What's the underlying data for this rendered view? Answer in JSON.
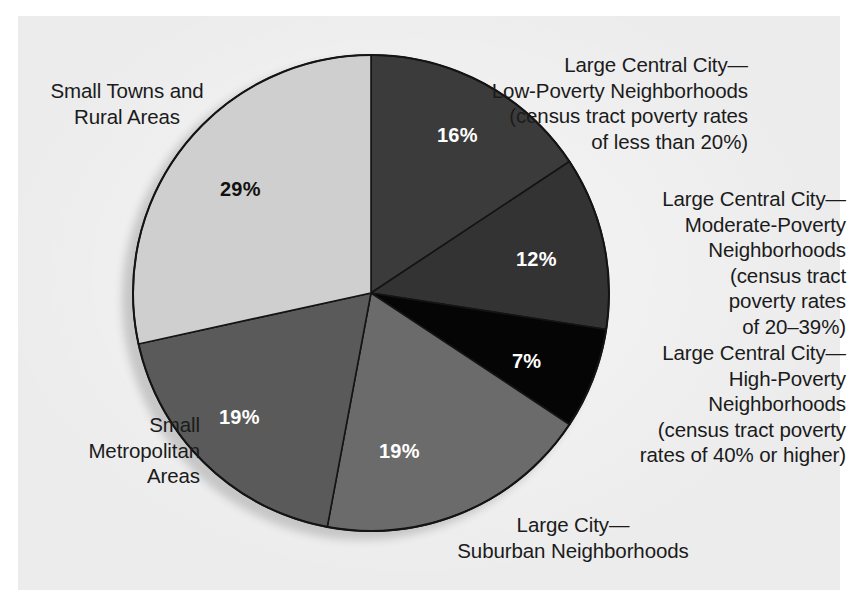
{
  "chart_data": {
    "type": "pie",
    "title": "",
    "subtitle": "",
    "xlabel": "",
    "ylabel": "",
    "legend_position": "callout-labels-around-pie",
    "grid": false,
    "start_angle_deg": 0,
    "direction": "clockwise",
    "total_percent": 102,
    "categories": [
      "Large Central City—Low-Poverty Neighborhoods (census tract poverty rates of less than 20%)",
      "Large Central City—Moderate-Poverty Neighborhoods (census tract poverty rates of 20–39%)",
      "Large Central City—High-Poverty Neighborhoods (census tract poverty rates of 40% or higher)",
      "Large City—Suburban Neighborhoods",
      "Small Metropolitan Areas",
      "Small Towns and Rural Areas"
    ],
    "values": [
      16,
      12,
      7,
      19,
      19,
      29
    ],
    "value_labels": [
      "16%",
      "12%",
      "7%",
      "19%",
      "19%",
      "29%"
    ],
    "slice_colors": [
      "#3b3b3b",
      "#333333",
      "#050505",
      "#6b6b6b",
      "#5a5a5a",
      "#cfcfcf"
    ],
    "slice_label_colors": [
      "#ffffff",
      "#ffffff",
      "#ffffff",
      "#ffffff",
      "#ffffff",
      "#111111"
    ],
    "slices": [
      {
        "name": "large-central-city-low-poverty",
        "value": 16,
        "label": "16%",
        "color": "#3b3b3b",
        "label_color": "#ffffff"
      },
      {
        "name": "large-central-city-moderate-poverty",
        "value": 12,
        "label": "12%",
        "color": "#333333",
        "label_color": "#ffffff"
      },
      {
        "name": "large-central-city-high-poverty",
        "value": 7,
        "label": "7%",
        "color": "#050505",
        "label_color": "#ffffff"
      },
      {
        "name": "large-city-suburban",
        "value": 19,
        "label": "19%",
        "color": "#6b6b6b",
        "label_color": "#ffffff"
      },
      {
        "name": "small-metropolitan-areas",
        "value": 19,
        "label": "19%",
        "color": "#5a5a5a",
        "label_color": "#ffffff"
      },
      {
        "name": "small-towns-and-rural-areas",
        "value": 29,
        "label": "29%",
        "color": "#cfcfcf",
        "label_color": "#111111"
      }
    ]
  },
  "callouts": {
    "large_central_city_low_poverty": "Large Central City—\nLow-Poverty Neighborhoods\n(census tract poverty rates\nof less than 20%)",
    "large_central_city_moderate_poverty": "Large Central City—\nModerate-Poverty\nNeighborhoods\n(census tract\npoverty rates\nof 20–39%)",
    "large_central_city_high_poverty": "Large Central City—\nHigh-Poverty\nNeighborhoods\n(census tract poverty\nrates of 40% or higher)",
    "large_city_suburban": "Large City—\nSuburban Neighborhoods",
    "small_metropolitan_areas": "Small\nMetropolitan\nAreas",
    "small_towns_and_rural_areas": "Small Towns and\nRural Areas"
  },
  "percent_labels": {
    "low_poverty": "16%",
    "moderate_poverty": "12%",
    "high_poverty": "7%",
    "suburban": "19%",
    "small_metro": "19%",
    "small_towns": "29%"
  },
  "colors": {
    "page_background": "#ffffff",
    "paper_background": "#ececed",
    "slice_outline": "#141414",
    "shadow": "#c6c6c6",
    "text": "#1b1b1b"
  }
}
